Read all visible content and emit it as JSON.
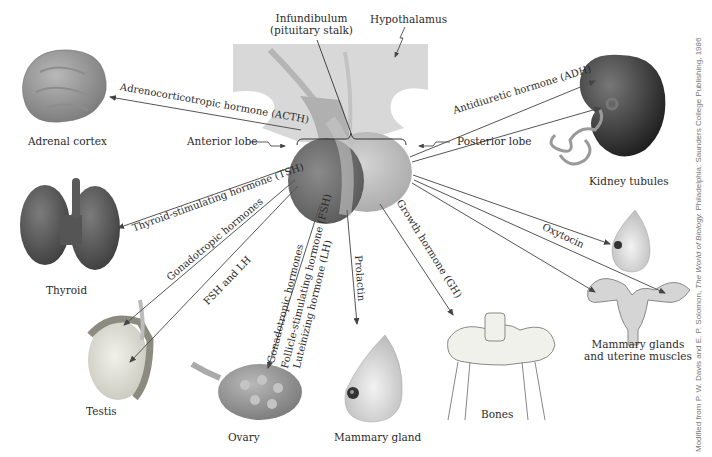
{
  "diagram": {
    "structures": {
      "infundibulum": "Infundibulum",
      "infundibulum_sub": "(pituitary stalk)",
      "hypothalamus": "Hypothalamus",
      "anterior_lobe": "Anterior lobe",
      "posterior_lobe": "Posterior lobe"
    },
    "targets": {
      "adrenal_cortex": "Adrenal cortex",
      "thyroid": "Thyroid",
      "testis": "Testis",
      "ovary": "Ovary",
      "mammary_gland": "Mammary gland",
      "bones": "Bones",
      "kidney_tubules": "Kidney tubules",
      "mammary_uterine_1": "Mammary glands",
      "mammary_uterine_2": "and uterine muscles"
    },
    "hormones": {
      "acth": "Adrenocorticotropic hormone (ACTH)",
      "tsh": "Thyroid-stimulating hormone (TSH)",
      "gonadotropic_male": "Gonadotropic hormones",
      "fsh_lh": "FSH and LH",
      "gonadotropic_female": "Gonadotropic hormones",
      "fsh_full": "Follicle-stimulating hormone (FSH)",
      "lh_full": "Luteinizing hormone (LH)",
      "prolactin": "Prolactin",
      "gh": "Growth hormone (GH)",
      "adh": "Antidiuretic hormone (ADH)",
      "oxytocin": "Oxytocin"
    },
    "credit": {
      "prefix": "Modified from P. W. Davis and E. P. Solomon, ",
      "book": "The World of Biology.",
      "suffix": " Philadelphia: Saunders College Publishing, 1986"
    },
    "colors": {
      "anterior": "#6e6e6e",
      "posterior": "#bdbdbd",
      "hypothalamus": "#d9d9d9",
      "arrow": "#555555",
      "kidney": "#3a3a3a"
    }
  }
}
